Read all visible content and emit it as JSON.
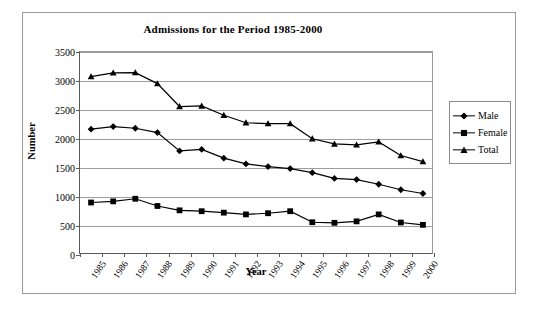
{
  "chart_data": {
    "type": "line",
    "title": "Admissions for the Period 1985-2000",
    "xlabel": "Year",
    "ylabel": "Number",
    "ylim": [
      0,
      3500
    ],
    "ytick_step": 500,
    "yticks": [
      "0",
      "500",
      "1000",
      "1500",
      "2000",
      "2500",
      "3000",
      "3500"
    ],
    "grid": true,
    "legend_position": "right",
    "categories": [
      "1985",
      "1986",
      "1987",
      "1988",
      "1989",
      "1990",
      "1991",
      "1992",
      "1993",
      "1994",
      "1995",
      "1996",
      "1997",
      "1998",
      "1999",
      "2000"
    ],
    "series": [
      {
        "name": "Male",
        "marker": "diamond",
        "values": [
          2170,
          2215,
          2185,
          2110,
          1795,
          1820,
          1670,
          1570,
          1525,
          1490,
          1420,
          1320,
          1300,
          1220,
          1125,
          1060
        ]
      },
      {
        "name": "Female",
        "marker": "square",
        "values": [
          905,
          925,
          970,
          845,
          770,
          755,
          730,
          700,
          720,
          755,
          565,
          555,
          580,
          700,
          560,
          520
        ]
      },
      {
        "name": "Total",
        "marker": "triangle",
        "values": [
          3075,
          3140,
          3145,
          2955,
          2560,
          2570,
          2410,
          2280,
          2265,
          2265,
          2005,
          1915,
          1900,
          1950,
          1715,
          1610
        ]
      }
    ]
  },
  "legend": {
    "items": [
      {
        "label": "Male"
      },
      {
        "label": "Female"
      },
      {
        "label": "Total"
      }
    ]
  }
}
